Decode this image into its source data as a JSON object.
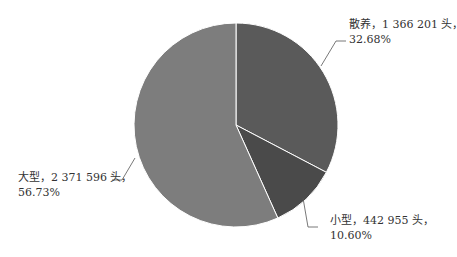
{
  "chart_data": {
    "type": "pie",
    "title": "",
    "categories": [
      "散养",
      "小型",
      "大型"
    ],
    "values": [
      1366201,
      442955,
      2371596
    ],
    "percents": [
      32.68,
      10.6,
      56.73
    ],
    "unit": "头",
    "colors": [
      "#5a5a5a",
      "#4a4a4a",
      "#7d7d7d"
    ],
    "start_angle_deg": 0,
    "direction": "clockwise",
    "legend": "none",
    "labels": [
      {
        "line1": "散养，1 366 201 头，",
        "line2": "32.68%"
      },
      {
        "line1": "小型，442 955 头，",
        "line2": "10.60%"
      },
      {
        "line1": "大型，2 371 596 头，",
        "line2": "56.73%"
      }
    ]
  }
}
